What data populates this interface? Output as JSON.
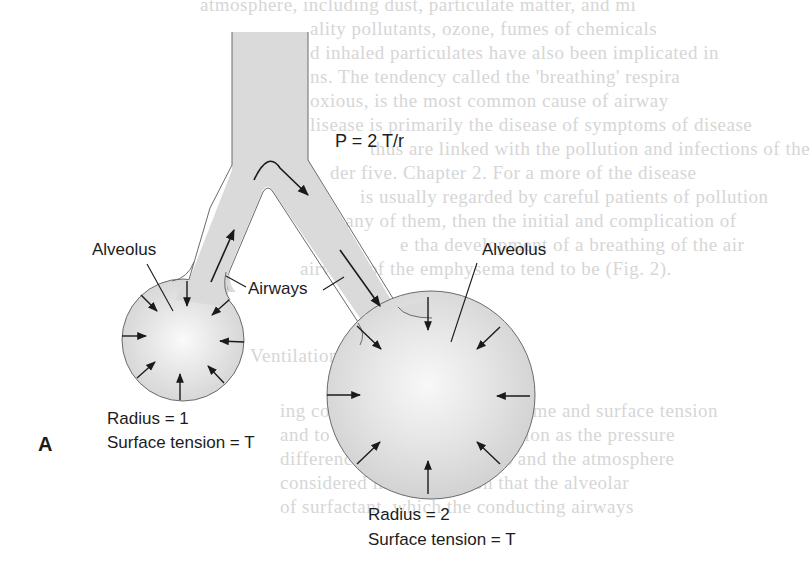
{
  "figure": {
    "panel_letter": "A",
    "equation": "P = 2 T/r",
    "labels": {
      "alveolus_small": "Alveolus",
      "alveolus_large": "Alveolus",
      "airways": "Airways"
    },
    "small_alveolus": {
      "radius_label": "Radius = 1",
      "tension_label": "Surface tension = T"
    },
    "large_alveolus": {
      "radius_label": "Radius = 2",
      "tension_label": "Surface tension = T"
    },
    "colors": {
      "fill": "#d9d9d9",
      "fill_center": "#f7f7f7",
      "outline": "#6a6a6a",
      "arrow": "#1a1a1a",
      "bleed_text": "#d6d6d6"
    }
  },
  "bleed_through_text": [
    "atmosphere, including dust, particulate matter, and mi",
    "ality pollutants, ozone, fumes of chemicals",
    "d inhaled particulates have also been implicated in",
    "ns. The tendency called the 'breathing' respira",
    "oxious, is the most common cause of airway",
    "lisease is primarily the disease of symptoms of disease",
    "thus are linked with the pollution and infections of the",
    "der five. Chapter 2. For a more of the disease",
    "is usually regarded by careful patients of pollution",
    "many of them, then the initial and complication of",
    "e tha development of a breathing of the air",
    "airways of the emphysema tend to be (Fig. 2).",
    "",
    "",
    "Ventilation",
    "",
    "ing continuing the flow of volume and surface tension",
    "and to avoid the forces of tension as the pressure",
    "difference between the lungs and the atmosphere",
    "considered in the equation that the alveolar",
    "of surfactant, which the conducting airways"
  ]
}
